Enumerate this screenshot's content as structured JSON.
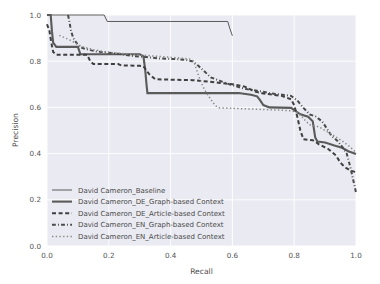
{
  "chart_data": {
    "type": "line",
    "title": "",
    "xlabel": "Recall",
    "ylabel": "Precision",
    "xlim": [
      0.0,
      1.0
    ],
    "ylim": [
      0.0,
      1.0
    ],
    "xticks": [
      "0.0",
      "0.2",
      "0.4",
      "0.6",
      "0.8",
      "1.0"
    ],
    "yticks": [
      "0.0",
      "0.2",
      "0.4",
      "0.6",
      "0.8",
      "1.0"
    ],
    "xtick_values": [
      0.0,
      0.2,
      0.4,
      0.6,
      0.8,
      1.0
    ],
    "ytick_values": [
      0.0,
      0.2,
      0.4,
      0.6,
      0.8,
      1.0
    ],
    "grid": true,
    "grid_color": "#ffffff",
    "plot_bgcolor": "#eaeaf2",
    "legend_position": "lower left",
    "series": [
      {
        "name": "David Cameron_Baseline",
        "linestyle": "solid",
        "linewidth": 0.9,
        "color": "#4a4a4a",
        "points": [
          [
            0.0,
            1.0
          ],
          [
            0.185,
            1.0
          ],
          [
            0.195,
            0.972
          ],
          [
            0.585,
            0.972
          ],
          [
            0.592,
            0.94
          ],
          [
            0.6,
            0.91
          ]
        ]
      },
      {
        "name": "David Cameron_DE_Graph-based Context",
        "linestyle": "solid",
        "linewidth": 2.1,
        "color": "#5a5a5a",
        "points": [
          [
            0.0,
            1.0
          ],
          [
            0.012,
            1.0
          ],
          [
            0.016,
            0.93
          ],
          [
            0.02,
            0.88
          ],
          [
            0.03,
            0.862
          ],
          [
            0.1,
            0.862
          ],
          [
            0.108,
            0.83
          ],
          [
            0.3,
            0.83
          ],
          [
            0.312,
            0.822
          ],
          [
            0.318,
            0.76
          ],
          [
            0.322,
            0.7
          ],
          [
            0.325,
            0.662
          ],
          [
            0.62,
            0.662
          ],
          [
            0.66,
            0.655
          ],
          [
            0.68,
            0.648
          ],
          [
            0.69,
            0.63
          ],
          [
            0.7,
            0.61
          ],
          [
            0.72,
            0.6
          ],
          [
            0.79,
            0.598
          ],
          [
            0.8,
            0.588
          ],
          [
            0.82,
            0.57
          ],
          [
            0.845,
            0.56
          ],
          [
            0.86,
            0.54
          ],
          [
            0.868,
            0.47
          ],
          [
            0.875,
            0.452
          ],
          [
            0.9,
            0.448
          ],
          [
            0.93,
            0.435
          ],
          [
            0.955,
            0.425
          ],
          [
            0.975,
            0.41
          ],
          [
            1.0,
            0.398
          ]
        ]
      },
      {
        "name": "David Cameron_DE_Article-based Context",
        "linestyle": "dashed",
        "linewidth": 2.0,
        "color": "#3f3f3f",
        "points": [
          [
            0.0,
            0.96
          ],
          [
            0.008,
            0.93
          ],
          [
            0.014,
            0.88
          ],
          [
            0.02,
            0.84
          ],
          [
            0.03,
            0.828
          ],
          [
            0.13,
            0.828
          ],
          [
            0.14,
            0.8
          ],
          [
            0.15,
            0.788
          ],
          [
            0.23,
            0.788
          ],
          [
            0.24,
            0.782
          ],
          [
            0.3,
            0.78
          ],
          [
            0.312,
            0.778
          ],
          [
            0.33,
            0.745
          ],
          [
            0.35,
            0.722
          ],
          [
            0.4,
            0.72
          ],
          [
            0.47,
            0.718
          ],
          [
            0.52,
            0.712
          ],
          [
            0.56,
            0.706
          ],
          [
            0.6,
            0.7
          ],
          [
            0.64,
            0.69
          ],
          [
            0.67,
            0.67
          ],
          [
            0.7,
            0.66
          ],
          [
            0.73,
            0.655
          ],
          [
            0.76,
            0.65
          ],
          [
            0.79,
            0.635
          ],
          [
            0.8,
            0.61
          ],
          [
            0.81,
            0.56
          ],
          [
            0.82,
            0.5
          ],
          [
            0.83,
            0.462
          ],
          [
            0.86,
            0.458
          ],
          [
            0.87,
            0.45
          ],
          [
            0.88,
            0.44
          ],
          [
            0.91,
            0.42
          ],
          [
            0.935,
            0.392
          ],
          [
            0.95,
            0.36
          ],
          [
            0.965,
            0.34
          ],
          [
            0.985,
            0.325
          ],
          [
            1.0,
            0.32
          ]
        ]
      },
      {
        "name": "David Cameron_EN_Graph-based Context",
        "linestyle": "dashdot",
        "linewidth": 2.0,
        "color": "#4a4a4a",
        "points": [
          [
            0.068,
            1.0
          ],
          [
            0.072,
            0.975
          ],
          [
            0.078,
            0.93
          ],
          [
            0.085,
            0.9
          ],
          [
            0.095,
            0.88
          ],
          [
            0.105,
            0.862
          ],
          [
            0.12,
            0.855
          ],
          [
            0.14,
            0.848
          ],
          [
            0.16,
            0.842
          ],
          [
            0.19,
            0.838
          ],
          [
            0.23,
            0.832
          ],
          [
            0.25,
            0.828
          ],
          [
            0.28,
            0.822
          ],
          [
            0.32,
            0.818
          ],
          [
            0.36,
            0.812
          ],
          [
            0.4,
            0.81
          ],
          [
            0.43,
            0.808
          ],
          [
            0.45,
            0.805
          ],
          [
            0.47,
            0.8
          ],
          [
            0.49,
            0.78
          ],
          [
            0.51,
            0.755
          ],
          [
            0.53,
            0.73
          ],
          [
            0.56,
            0.715
          ],
          [
            0.59,
            0.7
          ],
          [
            0.62,
            0.688
          ],
          [
            0.65,
            0.678
          ],
          [
            0.68,
            0.672
          ],
          [
            0.7,
            0.668
          ],
          [
            0.72,
            0.662
          ],
          [
            0.74,
            0.658
          ],
          [
            0.76,
            0.655
          ],
          [
            0.79,
            0.65
          ],
          [
            0.81,
            0.63
          ],
          [
            0.83,
            0.598
          ],
          [
            0.85,
            0.57
          ],
          [
            0.87,
            0.56
          ],
          [
            0.89,
            0.54
          ],
          [
            0.905,
            0.51
          ],
          [
            0.92,
            0.478
          ],
          [
            0.94,
            0.455
          ],
          [
            0.955,
            0.43
          ],
          [
            0.97,
            0.4
          ],
          [
            0.982,
            0.34
          ],
          [
            0.992,
            0.28
          ],
          [
            1.0,
            0.232
          ]
        ]
      },
      {
        "name": "David Cameron_EN_Article-based Context",
        "linestyle": "dotted",
        "linewidth": 1.5,
        "color": "#8a8a8a",
        "points": [
          [
            0.04,
            0.912
          ],
          [
            0.06,
            0.9
          ],
          [
            0.08,
            0.888
          ],
          [
            0.1,
            0.872
          ],
          [
            0.12,
            0.86
          ],
          [
            0.15,
            0.85
          ],
          [
            0.19,
            0.84
          ],
          [
            0.23,
            0.835
          ],
          [
            0.27,
            0.83
          ],
          [
            0.31,
            0.826
          ],
          [
            0.35,
            0.822
          ],
          [
            0.39,
            0.818
          ],
          [
            0.43,
            0.814
          ],
          [
            0.46,
            0.81
          ],
          [
            0.475,
            0.8
          ],
          [
            0.485,
            0.76
          ],
          [
            0.495,
            0.72
          ],
          [
            0.505,
            0.69
          ],
          [
            0.515,
            0.665
          ],
          [
            0.525,
            0.645
          ],
          [
            0.535,
            0.625
          ],
          [
            0.545,
            0.608
          ],
          [
            0.555,
            0.598
          ],
          [
            0.6,
            0.596
          ],
          [
            0.64,
            0.594
          ],
          [
            0.68,
            0.592
          ],
          [
            0.72,
            0.59
          ],
          [
            0.76,
            0.588
          ],
          [
            0.79,
            0.585
          ],
          [
            0.81,
            0.578
          ],
          [
            0.825,
            0.56
          ],
          [
            0.838,
            0.54
          ],
          [
            0.85,
            0.525
          ],
          [
            0.87,
            0.52
          ],
          [
            0.885,
            0.512
          ],
          [
            0.9,
            0.5
          ],
          [
            0.92,
            0.485
          ],
          [
            0.94,
            0.468
          ],
          [
            0.96,
            0.45
          ],
          [
            0.98,
            0.43
          ],
          [
            1.0,
            0.405
          ]
        ]
      }
    ]
  },
  "legend": {
    "items": [
      {
        "label": "David Cameron_Baseline",
        "style": "solid-thin"
      },
      {
        "label": "David Cameron_DE_Graph-based Context",
        "style": "solid-thick"
      },
      {
        "label": "David Cameron_DE_Article-based Context",
        "style": "dashed"
      },
      {
        "label": "David Cameron_EN_Graph-based Context",
        "style": "dashdot"
      },
      {
        "label": "David Cameron_EN_Article-based Context",
        "style": "dotted"
      }
    ]
  },
  "colors": {
    "plot_background": "#eaeaf2",
    "grid": "#ffffff",
    "text": "#4a4a4a",
    "figure_background": "#ffffff"
  }
}
